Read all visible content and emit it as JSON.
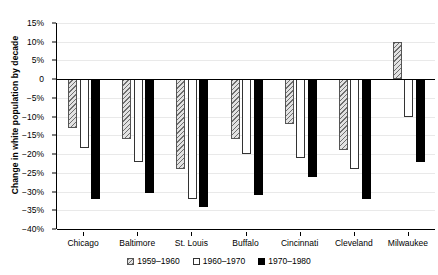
{
  "chart_data": {
    "type": "bar",
    "title": "",
    "xlabel": "",
    "ylabel": "Change in white population by decade",
    "categories": [
      "Chicago",
      "Baltimore",
      "St. Louis",
      "Buffalo",
      "Cincinnati",
      "Cleveland",
      "Milwaukee"
    ],
    "series": [
      {
        "name": "1959–1960",
        "style": "hatched",
        "values": [
          -13,
          -16,
          -24,
          -16,
          -12,
          -19,
          10
        ]
      },
      {
        "name": "1960–1970",
        "style": "white",
        "values": [
          -18.5,
          -22,
          -32,
          -20,
          -21,
          -24,
          -10
        ]
      },
      {
        "name": "1970–1980",
        "style": "black",
        "values": [
          -32,
          -30.5,
          -34,
          -31,
          -26,
          -32,
          -22
        ]
      }
    ],
    "ylim": [
      -40,
      15
    ],
    "ytick_values": [
      15,
      10,
      5,
      0,
      -5,
      -10,
      -15,
      -20,
      -25,
      -30,
      -35,
      -40
    ],
    "ytick_labels": [
      "15%",
      "10%",
      "5%",
      "0",
      "−5%",
      "−10%",
      "−15%",
      "−20%",
      "−25%",
      "−30%",
      "−35%",
      "−40%"
    ],
    "grid": true,
    "legend_position": "bottom",
    "legend": [
      "1959–1960",
      "1960–1970",
      "1970–1980"
    ],
    "colors": {
      "series_1959_1960": "#e2e2e2",
      "series_1960_1970": "#ffffff",
      "series_1970_1980": "#000000",
      "axis": "#000000",
      "grid": "#e9e9e9"
    }
  }
}
